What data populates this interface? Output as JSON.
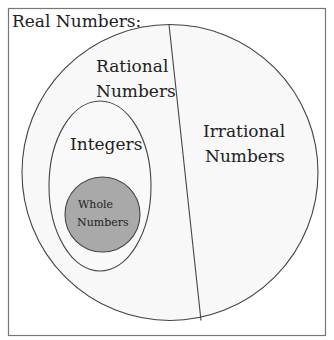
{
  "diagram": {
    "title": "Real Numbers:",
    "sets": {
      "real": {
        "label": "Real Numbers:"
      },
      "rational": {
        "line1": "Rational",
        "line2": "Numbers"
      },
      "irrational": {
        "line1": "Irrational",
        "line2": "Numbers"
      },
      "integers": {
        "label": "Integers"
      },
      "whole": {
        "line1": "Whole",
        "line2": "Numbers"
      }
    },
    "colors": {
      "background": "#ffffff",
      "region_fill": "#f7f7f7",
      "stroke": "#444444",
      "frame": "#777777",
      "whole_fill": "#a9a9a9"
    }
  }
}
